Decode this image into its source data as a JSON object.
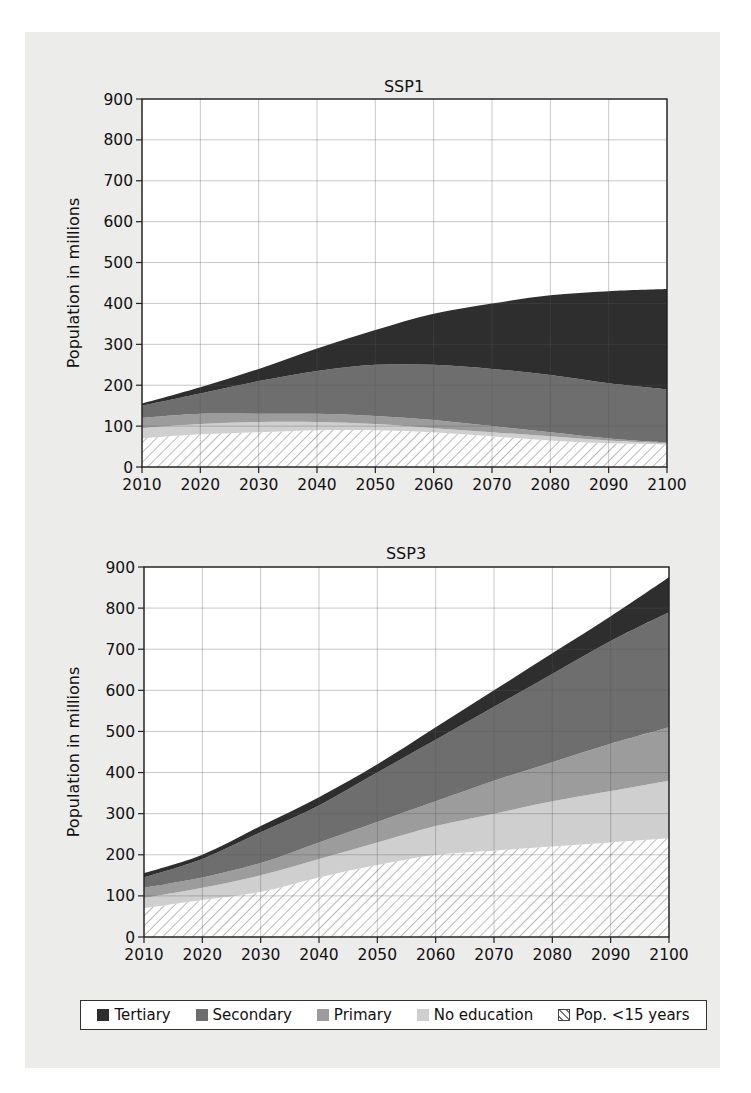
{
  "chart_data": [
    {
      "type": "area",
      "stacked": true,
      "title": "SSP1",
      "xlabel": "",
      "ylabel": "Population in millions",
      "x": [
        2010,
        2020,
        2030,
        2040,
        2050,
        2060,
        2070,
        2080,
        2090,
        2100
      ],
      "xticks": [
        "2010",
        "2020",
        "2030",
        "2040",
        "2050",
        "2060",
        "2070",
        "2080",
        "2090",
        "2100"
      ],
      "yticks": [
        "0",
        "100",
        "200",
        "300",
        "400",
        "500",
        "600",
        "700",
        "800",
        "900"
      ],
      "ylim": [
        0,
        900
      ],
      "grid": true,
      "series": [
        {
          "name": "Pop. <15 years",
          "values": [
            70,
            80,
            85,
            90,
            90,
            85,
            75,
            65,
            58,
            55
          ]
        },
        {
          "name": "No education",
          "values": [
            25,
            25,
            25,
            20,
            15,
            10,
            10,
            10,
            7,
            3
          ]
        },
        {
          "name": "Primary",
          "values": [
            25,
            25,
            20,
            20,
            20,
            20,
            15,
            10,
            5,
            2
          ]
        },
        {
          "name": "Secondary",
          "values": [
            30,
            50,
            80,
            105,
            125,
            135,
            140,
            140,
            135,
            130
          ]
        },
        {
          "name": "Tertiary",
          "values": [
            5,
            15,
            30,
            55,
            85,
            125,
            160,
            195,
            225,
            245
          ]
        }
      ],
      "totals": [
        155,
        195,
        240,
        290,
        335,
        375,
        400,
        420,
        430,
        435
      ]
    },
    {
      "type": "area",
      "stacked": true,
      "title": "SSP3",
      "xlabel": "",
      "ylabel": "Population in millions",
      "x": [
        2010,
        2020,
        2030,
        2040,
        2050,
        2060,
        2070,
        2080,
        2090,
        2100
      ],
      "xticks": [
        "2010",
        "2020",
        "2030",
        "2040",
        "2050",
        "2060",
        "2070",
        "2080",
        "2090",
        "2100"
      ],
      "yticks": [
        "0",
        "100",
        "200",
        "300",
        "400",
        "500",
        "600",
        "700",
        "800",
        "900"
      ],
      "ylim": [
        0,
        900
      ],
      "grid": true,
      "series": [
        {
          "name": "Pop. <15 years",
          "values": [
            70,
            90,
            110,
            145,
            175,
            200,
            210,
            220,
            230,
            240
          ]
        },
        {
          "name": "No education",
          "values": [
            25,
            30,
            40,
            45,
            55,
            70,
            90,
            110,
            125,
            140
          ]
        },
        {
          "name": "Primary",
          "values": [
            25,
            25,
            30,
            40,
            50,
            60,
            80,
            95,
            115,
            130
          ]
        },
        {
          "name": "Secondary",
          "values": [
            25,
            45,
            75,
            90,
            120,
            150,
            180,
            215,
            250,
            280
          ]
        },
        {
          "name": "Tertiary",
          "values": [
            10,
            10,
            15,
            20,
            20,
            30,
            40,
            50,
            60,
            85
          ]
        }
      ],
      "totals": [
        155,
        200,
        270,
        340,
        420,
        510,
        600,
        690,
        780,
        875
      ]
    }
  ],
  "legend": {
    "position": "bottom",
    "items": [
      {
        "label": "Tertiary",
        "color": "#2e2e2e",
        "pattern": "solid"
      },
      {
        "label": "Secondary",
        "color": "#6e6e6e",
        "pattern": "solid"
      },
      {
        "label": "Primary",
        "color": "#9c9c9c",
        "pattern": "solid"
      },
      {
        "label": "No education",
        "color": "#cfcfcf",
        "pattern": "solid"
      },
      {
        "label": "Pop. <15 years",
        "color": "#ffffff",
        "pattern": "hatch"
      }
    ]
  },
  "colors": {
    "tertiary": "#2e2e2e",
    "secondary": "#6e6e6e",
    "primary": "#9c9c9c",
    "no_education": "#cfcfcf",
    "under15_hatch": "#8a8a8a",
    "panel_background": "#ececea",
    "grid": "#555555"
  }
}
